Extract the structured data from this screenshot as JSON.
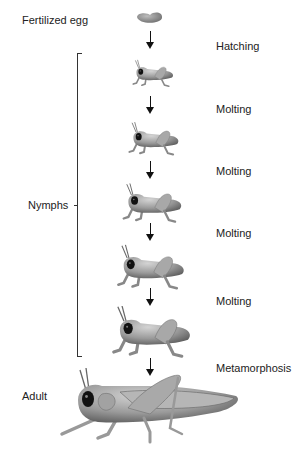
{
  "diagram": {
    "stages": [
      {
        "id": "egg",
        "label": "Fertilized egg"
      },
      {
        "id": "nymph1",
        "label": ""
      },
      {
        "id": "nymph2",
        "label": ""
      },
      {
        "id": "nymph3",
        "label": ""
      },
      {
        "id": "nymph4",
        "label": ""
      },
      {
        "id": "nymph5",
        "label": ""
      },
      {
        "id": "adult",
        "label": "Adult"
      }
    ],
    "group_label": "Nymphs",
    "transitions": [
      "Hatching",
      "Molting",
      "Molting",
      "Molting",
      "Molting",
      "Metamorphosis"
    ],
    "colors": {
      "insect_body": "#9a9a9a",
      "egg": "#8d8d8d",
      "arrow": "#111111",
      "text": "#222222"
    }
  }
}
